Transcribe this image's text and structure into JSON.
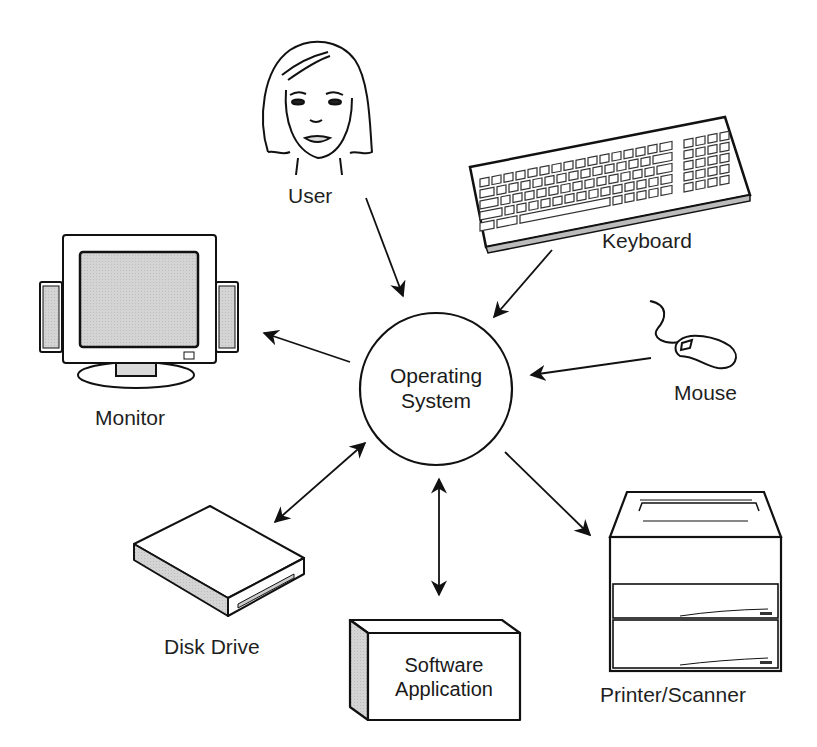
{
  "center": {
    "line1": "Operating",
    "line2": "System"
  },
  "nodes": {
    "user": {
      "label": "User",
      "icon": "person-face-icon",
      "direction": "to-os"
    },
    "keyboard": {
      "label": "Keyboard",
      "icon": "keyboard-icon",
      "direction": "to-os"
    },
    "mouse": {
      "label": "Mouse",
      "icon": "mouse-icon",
      "direction": "to-os"
    },
    "monitor": {
      "label": "Monitor",
      "icon": "monitor-icon",
      "direction": "from-os"
    },
    "printer": {
      "label": "Printer/Scanner",
      "icon": "printer-icon",
      "direction": "from-os"
    },
    "disk": {
      "label": "Disk Drive",
      "icon": "disk-drive-icon",
      "direction": "bidirectional"
    },
    "software": {
      "line1": "Software",
      "line2": "Application",
      "icon": "software-box-icon",
      "direction": "bidirectional"
    }
  },
  "colors": {
    "stroke": "#111111",
    "fill_gray": "#d9d9d9",
    "background": "#ffffff"
  }
}
